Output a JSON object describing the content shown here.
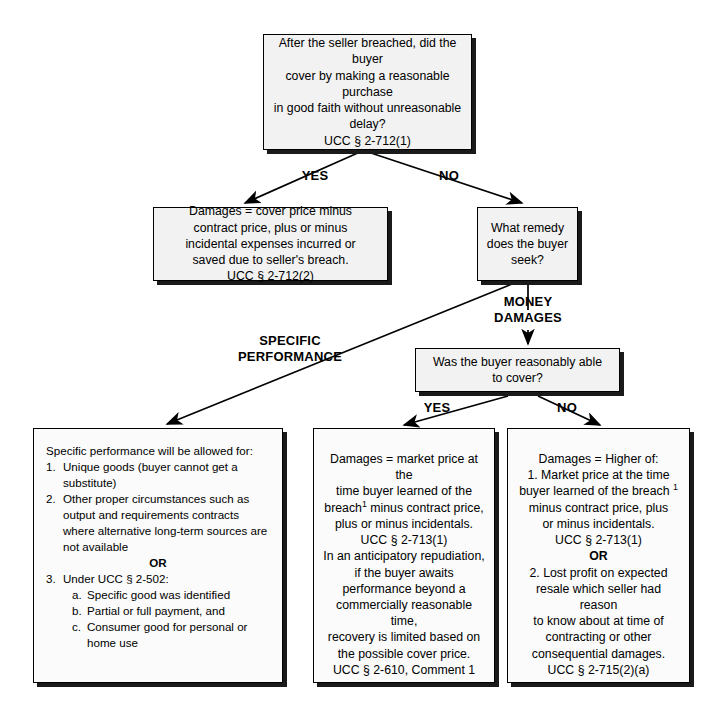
{
  "diagram": {
    "nodes": {
      "root": {
        "line1": "After the seller breached, did the buyer",
        "line2": "cover by making a reasonable purchase",
        "line3": "in good faith without unreasonable",
        "line4": "delay?",
        "cite": "UCC § 2-712(1)"
      },
      "cover_damages": {
        "line1": "Damages = cover price minus",
        "line2": "contract price, plus or minus",
        "line3": "incidental expenses incurred or",
        "line4": "saved due to seller's breach.",
        "cite": "UCC § 2-712(2)"
      },
      "remedy_question": {
        "line1": "What remedy",
        "line2": "does the buyer",
        "line3": "seek?"
      },
      "able_to_cover": {
        "line1": "Was the buyer reasonably able",
        "line2": "to cover?"
      },
      "specific_performance": {
        "lead": "Specific performance will be allowed for:",
        "item1_marker": "1.",
        "item1_text": "Unique goods (buyer cannot get a substitute)",
        "item2_marker": "2.",
        "item2_text": "Other proper circumstances such as output and requirements contracts where alternative long-term sources are not available",
        "or": "OR",
        "item3_marker": "3.",
        "item3_text": "Under UCC § 2-502:",
        "sub_a_marker": "a.",
        "sub_a_text": "Specific good was identified",
        "sub_b_marker": "b.",
        "sub_b_text": "Partial or full payment, and",
        "sub_c_marker": "c.",
        "sub_c_text": "Consumer good for personal or home use"
      },
      "market_price_damages": {
        "p1_line1": "Damages = market price at the",
        "p1_line2": "time buyer learned of the",
        "p1_line3_pre": "breach",
        "p1_line3_sup": "1",
        "p1_line3_post": " minus contract price,",
        "p1_line4": "plus or minus incidentals.",
        "cite1": "UCC § 2-713(1)",
        "p2_line1": "In an anticipatory repudiation,",
        "p2_line2": "if the buyer awaits",
        "p2_line3": "performance beyond a",
        "p2_line4": "commercially reasonable time,",
        "p2_line5": "recovery is limited based on",
        "p2_line6": "the possible cover price.",
        "cite2": "UCC § 2-610, Comment 1"
      },
      "higher_of_damages": {
        "lead": "Damages = Higher of:",
        "p1_line1": "1. Market price at the time",
        "p1_line2_pre": "buyer learned of the breach ",
        "p1_line2_sup": "1",
        "p1_line3": "minus contract price, plus",
        "p1_line4": "or minus incidentals.",
        "cite1": "UCC § 2-713(1)",
        "or": "OR",
        "p2_line1": "2. Lost profit on expected",
        "p2_line2": "resale which seller had reason",
        "p2_line3": "to know about at time of",
        "p2_line4": "contracting or other",
        "p2_line5": "consequential damages.",
        "cite2": "UCC § 2-715(2)(a)"
      }
    },
    "edge_labels": {
      "root_yes": "YES",
      "root_no": "NO",
      "money_damages": "MONEY\nDAMAGES",
      "specific_performance": "SPECIFIC\nPERFORMANCE",
      "cover_yes": "YES",
      "cover_no": "NO"
    },
    "colors": {
      "box_fill": "#f2f2f2",
      "box_border": "#000000",
      "shadow": "#1a1a1a",
      "text": "#000000",
      "background": "#ffffff"
    }
  }
}
